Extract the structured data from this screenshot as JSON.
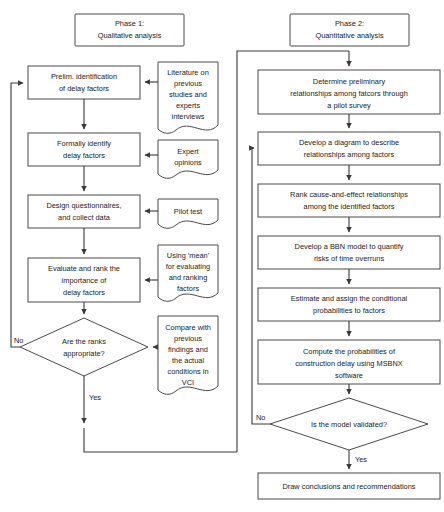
{
  "diagram": {
    "colors": {
      "stroke": "#4a4a4a",
      "connector": "#3a3a3a",
      "text": "#1a1a1a",
      "background": "#ffffff"
    },
    "phase1": {
      "header": [
        "Phase 1:",
        "Qualitative analysis"
      ],
      "steps": [
        {
          "id": "p1s1",
          "lines": [
            "Prelim. identification",
            "of delay factors"
          ]
        },
        {
          "id": "p1s2",
          "lines": [
            "Formally identify",
            "delay factors"
          ]
        },
        {
          "id": "p1s3",
          "lines": [
            "Design questionnaires,",
            "and collect data"
          ]
        },
        {
          "id": "p1s4",
          "lines": [
            "Evaluate and rank the",
            "importance of",
            "delay factors"
          ]
        }
      ],
      "decision": {
        "id": "p1d1",
        "lines": [
          "Are the ranks",
          "appropriate?"
        ]
      },
      "documents": [
        {
          "id": "p1doc1",
          "lines": [
            "Literature on",
            "previous",
            "studies and",
            "experts",
            "interviews"
          ]
        },
        {
          "id": "p1doc2",
          "lines": [
            "Expert",
            "opinions"
          ]
        },
        {
          "id": "p1doc3",
          "lines": [
            "Pilot test"
          ]
        },
        {
          "id": "p1doc4",
          "lines": [
            "Using 'mean'",
            "for evaluating",
            "and ranking",
            "factors"
          ]
        },
        {
          "id": "p1doc5",
          "lines": [
            "Compare with",
            "previous",
            "findings and",
            "the actual",
            "conditions in",
            "VCI"
          ]
        }
      ],
      "edge_labels": {
        "no": "No",
        "yes": "Yes"
      }
    },
    "phase2": {
      "header": [
        "Phase 2:",
        "Quantitative analysis"
      ],
      "steps": [
        {
          "id": "p2s1",
          "lines": [
            "Determine preliminary",
            "relationships among fatcors through",
            "a pilot survey"
          ]
        },
        {
          "id": "p2s2",
          "lines": [
            "Develop a diagram to describe",
            "relationships among factors"
          ]
        },
        {
          "id": "p2s3",
          "lines": [
            "Rank cause-and-effect relationships",
            "among the identified factors"
          ]
        },
        {
          "id": "p2s4",
          "lines": [
            "Develop a BBN model to quantify",
            "risks of time overruns"
          ]
        },
        {
          "id": "p2s5",
          "lines": [
            "Estimate and assign the conditional",
            "probabilities to factors"
          ]
        },
        {
          "id": "p2s6",
          "lines": [
            "Compute the probabilities of",
            "construction delay using MSBNX",
            "software"
          ]
        }
      ],
      "decision": {
        "id": "p2d1",
        "lines": [
          "Is the model validated?"
        ]
      },
      "final": {
        "id": "p2end",
        "lines": [
          "Draw conclusions and recommendations"
        ]
      },
      "edge_labels": {
        "no": "No",
        "yes": "Yes"
      }
    }
  }
}
